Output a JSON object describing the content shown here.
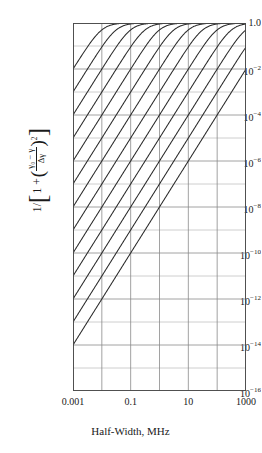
{
  "figure": {
    "xlabel": "Half-Width, MHz",
    "ylabel_parts": {
      "lead": "1/",
      "bracket_open": "[",
      "one_plus": "1 +",
      "paren_open": "(",
      "numerator": "γ₀ − γ",
      "denominator": "Δγ",
      "paren_close": ")",
      "exponent": "2",
      "bracket_close": "]"
    },
    "ylabel_plain": "1/[1 + ((γ₀ − γ)/Δγ)²]",
    "ytick_labels": [
      "1.0",
      "10",
      "10",
      "10",
      "10",
      "10",
      "10",
      "10",
      "10"
    ],
    "ytick_exponents": [
      "",
      "−2",
      "−4",
      "−6",
      "−8",
      "−10",
      "−12",
      "−14",
      "−16"
    ],
    "xtick_labels": [
      "0.001",
      "0.1",
      "10",
      "1000"
    ],
    "line_color": "#2b2b2b",
    "grid_color": "#8a8a8a",
    "axis_color": "#4a4a4a",
    "background": "#ffffff"
  },
  "chart_data": {
    "type": "line",
    "title": "",
    "xlabel": "Half-Width, MHz",
    "ylabel": "1/[1 + ((γ₀ − γ)/Δγ)²]",
    "xscale": "log",
    "yscale": "log",
    "xlim": [
      0.001,
      1000
    ],
    "ylim": [
      1e-16,
      1.0
    ],
    "xticks": [
      0.001,
      0.1,
      10,
      1000
    ],
    "xtick_labels": [
      "0.001",
      "0.1",
      "10",
      "1000"
    ],
    "xminor_decades": [
      0.001,
      0.01,
      0.1,
      1,
      10,
      100,
      1000
    ],
    "yticks": [
      1.0,
      0.01,
      0.0001,
      1e-06,
      1e-08,
      1e-10,
      1e-12,
      1e-14,
      1e-16
    ],
    "ytick_labels": [
      "1.0",
      "10⁻²",
      "10⁻⁴",
      "10⁻⁶",
      "10⁻⁸",
      "10⁻¹⁰",
      "10⁻¹²",
      "10⁻¹⁴",
      "10⁻¹⁶"
    ],
    "grid": true,
    "legend": "none",
    "annotations": [],
    "series_note": "Family of Lorentzian lineshape curves; each is y = 1/(1+(d/x)^2) plotted vs half-width x (MHz) for a fixed detuning d = (γ₀ − γ). On log-log axes each curve is a straight line of slope 2 in the wing region and saturates at y = 1.0. Successive curves are offset by half a decade of detuning.",
    "series": [
      {
        "name": "d = 10^-2.00 MHz",
        "detuning": 0.01,
        "log10_detuning": -2.0,
        "slope": 2,
        "saturates_at": 1.0
      },
      {
        "name": "d = 10^-1.50 MHz",
        "detuning": 0.0316228,
        "log10_detuning": -1.5,
        "slope": 2,
        "saturates_at": 1.0
      },
      {
        "name": "d = 10^-1.00 MHz",
        "detuning": 0.1,
        "log10_detuning": -1.0,
        "slope": 2,
        "saturates_at": 1.0
      },
      {
        "name": "d = 10^-0.50 MHz",
        "detuning": 0.316228,
        "log10_detuning": -0.5,
        "slope": 2,
        "saturates_at": 1.0
      },
      {
        "name": "d = 10^0.00 MHz",
        "detuning": 1.0,
        "log10_detuning": 0.0,
        "slope": 2,
        "saturates_at": 1.0
      },
      {
        "name": "d = 10^0.50 MHz",
        "detuning": 3.16228,
        "log10_detuning": 0.5,
        "slope": 2,
        "saturates_at": 1.0
      },
      {
        "name": "d = 10^1.00 MHz",
        "detuning": 10.0,
        "log10_detuning": 1.0,
        "slope": 2,
        "saturates_at": 1.0
      },
      {
        "name": "d = 10^1.50 MHz",
        "detuning": 31.6228,
        "log10_detuning": 1.5,
        "slope": 2,
        "saturates_at": 1.0
      },
      {
        "name": "d = 10^2.00 MHz",
        "detuning": 100.0,
        "log10_detuning": 2.0,
        "slope": 2,
        "saturates_at": 1.0
      },
      {
        "name": "d = 10^2.50 MHz",
        "detuning": 316.228,
        "log10_detuning": 2.5,
        "slope": 2,
        "saturates_at": 1.0
      },
      {
        "name": "d = 10^3.00 MHz",
        "detuning": 1000.0,
        "log10_detuning": 3.0,
        "slope": 2,
        "saturates_at": 1.0
      },
      {
        "name": "d = 10^3.50 MHz",
        "detuning": 3162.28,
        "log10_detuning": 3.5,
        "slope": 2,
        "saturates_at": 1.0
      },
      {
        "name": "d = 10^4.00 MHz",
        "detuning": 10000.0,
        "log10_detuning": 4.0,
        "slope": 2,
        "saturates_at": 1.0
      }
    ]
  }
}
